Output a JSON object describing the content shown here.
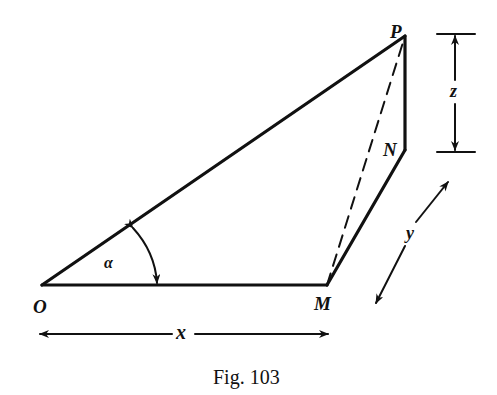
{
  "figure": {
    "caption": "Fig. 103",
    "points": {
      "O": "O",
      "M": "M",
      "P": "P",
      "N": "N"
    },
    "dimensions": {
      "x": "x",
      "y": "y",
      "z": "z"
    },
    "angle": "α",
    "line_color": "#111111"
  }
}
